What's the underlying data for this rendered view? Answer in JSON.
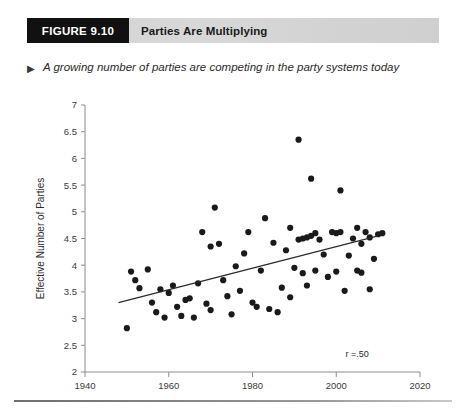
{
  "figure": {
    "badge_label": "FIGURE 9.10",
    "title": "Parties Are Multiplying",
    "caption_bullet": "▶",
    "caption": "A growing number of parties are competing in the party systems today"
  },
  "colors": {
    "badge_bg": "#111111",
    "header_bar": "#d4d4d4",
    "point": "#1a1a1a",
    "axis": "#8c8c8c",
    "trendline": "#2b2b2b"
  },
  "chart_data": {
    "type": "scatter",
    "title": "Parties Are Multiplying",
    "xlabel": "",
    "ylabel": "Effective Number of Parties",
    "xlim": [
      1940,
      2020
    ],
    "ylim": [
      2,
      7
    ],
    "xticks": [
      1940,
      1960,
      1980,
      2000,
      2020
    ],
    "xtick_labels": [
      "1940",
      "1960",
      "1980",
      "2000",
      "2020"
    ],
    "yticks": [
      2,
      2.5,
      3,
      3.5,
      4,
      4.5,
      5,
      5.5,
      6,
      6.5,
      7
    ],
    "ytick_labels": [
      "2",
      "2.5",
      "3",
      "3.5",
      "4",
      "4.5",
      "5",
      "5.5",
      "6",
      "6.5",
      "7"
    ],
    "grid": false,
    "legend": false,
    "annotations": [
      {
        "text": "r =.50",
        "x": 2005,
        "y": 2.28
      }
    ],
    "trendline": {
      "type": "linear",
      "x": [
        1948,
        2010
      ],
      "y": [
        3.3,
        4.55
      ],
      "r": 0.5
    },
    "points": [
      {
        "x": 1950,
        "y": 2.82
      },
      {
        "x": 1951,
        "y": 3.88
      },
      {
        "x": 1952,
        "y": 3.72
      },
      {
        "x": 1953,
        "y": 3.57
      },
      {
        "x": 1955,
        "y": 3.92
      },
      {
        "x": 1956,
        "y": 3.3
      },
      {
        "x": 1957,
        "y": 3.12
      },
      {
        "x": 1958,
        "y": 3.55
      },
      {
        "x": 1959,
        "y": 3.02
      },
      {
        "x": 1960,
        "y": 3.48
      },
      {
        "x": 1961,
        "y": 3.62
      },
      {
        "x": 1962,
        "y": 3.22
      },
      {
        "x": 1963,
        "y": 3.05
      },
      {
        "x": 1964,
        "y": 3.35
      },
      {
        "x": 1965,
        "y": 3.38
      },
      {
        "x": 1966,
        "y": 3.02
      },
      {
        "x": 1967,
        "y": 3.66
      },
      {
        "x": 1968,
        "y": 4.62
      },
      {
        "x": 1969,
        "y": 3.28
      },
      {
        "x": 1970,
        "y": 4.35
      },
      {
        "x": 1970,
        "y": 3.16
      },
      {
        "x": 1971,
        "y": 5.08
      },
      {
        "x": 1972,
        "y": 4.4
      },
      {
        "x": 1973,
        "y": 3.72
      },
      {
        "x": 1974,
        "y": 3.42
      },
      {
        "x": 1975,
        "y": 3.08
      },
      {
        "x": 1976,
        "y": 3.98
      },
      {
        "x": 1977,
        "y": 3.52
      },
      {
        "x": 1978,
        "y": 4.22
      },
      {
        "x": 1979,
        "y": 4.62
      },
      {
        "x": 1980,
        "y": 3.3
      },
      {
        "x": 1981,
        "y": 3.22
      },
      {
        "x": 1982,
        "y": 3.9
      },
      {
        "x": 1983,
        "y": 4.88
      },
      {
        "x": 1984,
        "y": 3.18
      },
      {
        "x": 1985,
        "y": 4.42
      },
      {
        "x": 1986,
        "y": 3.12
      },
      {
        "x": 1987,
        "y": 3.58
      },
      {
        "x": 1988,
        "y": 4.28
      },
      {
        "x": 1989,
        "y": 4.7
      },
      {
        "x": 1989,
        "y": 3.4
      },
      {
        "x": 1990,
        "y": 3.95
      },
      {
        "x": 1991,
        "y": 6.35
      },
      {
        "x": 1991,
        "y": 4.48
      },
      {
        "x": 1992,
        "y": 4.5
      },
      {
        "x": 1992,
        "y": 3.85
      },
      {
        "x": 1993,
        "y": 4.52
      },
      {
        "x": 1993,
        "y": 3.62
      },
      {
        "x": 1994,
        "y": 5.62
      },
      {
        "x": 1994,
        "y": 4.55
      },
      {
        "x": 1995,
        "y": 4.6
      },
      {
        "x": 1995,
        "y": 3.9
      },
      {
        "x": 1996,
        "y": 4.48
      },
      {
        "x": 1997,
        "y": 4.2
      },
      {
        "x": 1998,
        "y": 3.78
      },
      {
        "x": 1999,
        "y": 4.62
      },
      {
        "x": 2000,
        "y": 4.6
      },
      {
        "x": 2000,
        "y": 3.88
      },
      {
        "x": 2001,
        "y": 5.4
      },
      {
        "x": 2001,
        "y": 4.62
      },
      {
        "x": 2002,
        "y": 3.52
      },
      {
        "x": 2003,
        "y": 4.18
      },
      {
        "x": 2004,
        "y": 4.5
      },
      {
        "x": 2005,
        "y": 4.7
      },
      {
        "x": 2005,
        "y": 3.9
      },
      {
        "x": 2006,
        "y": 4.4
      },
      {
        "x": 2006,
        "y": 3.86
      },
      {
        "x": 2007,
        "y": 4.62
      },
      {
        "x": 2008,
        "y": 4.52
      },
      {
        "x": 2008,
        "y": 3.55
      },
      {
        "x": 2009,
        "y": 4.12
      },
      {
        "x": 2010,
        "y": 4.58
      },
      {
        "x": 2011,
        "y": 4.6
      }
    ]
  }
}
